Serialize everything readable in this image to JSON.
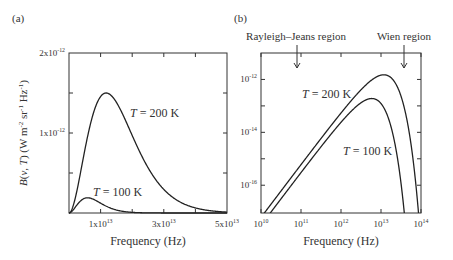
{
  "chart_data": [
    {
      "panel": "(a)",
      "type": "line",
      "title": "",
      "xlabel": "Frequency (Hz)",
      "ylabel": "B(ν, T) (W m⁻² sr⁻¹ Hz⁻¹)",
      "xscale": "linear",
      "yscale": "linear",
      "xlim": [
        0,
        50000000000000.0
      ],
      "ylim": [
        0,
        2e-12
      ],
      "x_ticks": [
        {
          "value": 10000000000000.0,
          "label": "1x10",
          "exp": "13"
        },
        {
          "value": 30000000000000.0,
          "label": "3x10",
          "exp": "13"
        },
        {
          "value": 50000000000000.0,
          "label": "5x10",
          "exp": "13"
        }
      ],
      "y_ticks": [
        {
          "value": 1e-12,
          "label": "1x10",
          "exp": "-12"
        },
        {
          "value": 2e-12,
          "label": "2x10",
          "exp": "-12"
        }
      ],
      "grid": false,
      "series": [
        {
          "name": "T = 200 K",
          "temperature_K": 200,
          "peak_x": 11800000000000.0,
          "peak_y": 1.5e-12
        },
        {
          "name": "T = 100 K",
          "temperature_K": 100,
          "peak_x": 5900000000000.0,
          "peak_y": 1.9e-13
        }
      ],
      "annotations": [
        {
          "text_italic": "T",
          "text": " = 200 K",
          "x": 22000000000000.0,
          "y": 1.2e-12
        },
        {
          "text_italic": "T",
          "text": " = 100 K",
          "x": 7000000000000.0,
          "y": 3e-13
        }
      ]
    },
    {
      "panel": "(b)",
      "type": "line",
      "title": "",
      "xlabel": "Frequency (Hz)",
      "ylabel": "",
      "xscale": "log",
      "yscale": "log",
      "xlim": [
        10000000000.0,
        100000000000000.0
      ],
      "ylim": [
        1e-17,
        1e-11
      ],
      "x_ticks": [
        {
          "value": 10000000000.0,
          "label": "10",
          "exp": "10"
        },
        {
          "value": 100000000000.0,
          "label": "10",
          "exp": "11"
        },
        {
          "value": 1000000000000.0,
          "label": "10",
          "exp": "12"
        },
        {
          "value": 10000000000000.0,
          "label": "10",
          "exp": "13"
        },
        {
          "value": 100000000000000.0,
          "label": "10",
          "exp": "14"
        }
      ],
      "y_ticks": [
        {
          "value": 1e-12,
          "label": "10",
          "exp": "-12"
        },
        {
          "value": 1e-14,
          "label": "10",
          "exp": "-14"
        },
        {
          "value": 1e-16,
          "label": "10",
          "exp": "-16"
        }
      ],
      "grid": false,
      "series": [
        {
          "name": "T = 200 K",
          "temperature_K": 200,
          "peak_x": 11800000000000.0,
          "peak_y": 1.5e-12
        },
        {
          "name": "T = 100 K",
          "temperature_K": 100,
          "peak_x": 5900000000000.0,
          "peak_y": 1.9e-13
        }
      ],
      "annotations": [
        {
          "text_italic": "T",
          "text": " = 200 K"
        },
        {
          "text_italic": "T",
          "text": " = 100 K"
        },
        {
          "text": "Rayleigh–Jeans region",
          "arrow_x": 80000000000.0
        },
        {
          "text": "Wien region",
          "arrow_x": 30000000000000.0
        }
      ]
    }
  ],
  "labels": {
    "panel_a": "(a)",
    "panel_b": "(b)",
    "xlabel_a": "Frequency (Hz)",
    "xlabel_b": "Frequency (Hz)",
    "rj_region": "Rayleigh–Jeans region",
    "wien_region": "Wien region"
  },
  "colors": {
    "line": "#222222",
    "axis": "#333333",
    "text": "#333333"
  }
}
